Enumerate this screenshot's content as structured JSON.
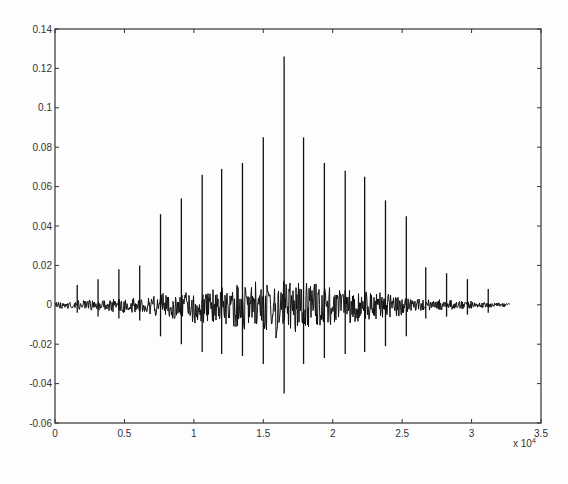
{
  "chart_data": {
    "type": "line",
    "title": "",
    "xlabel": "",
    "ylabel": "",
    "x_multiplier_label": "x 10^4",
    "xlim": [
      0,
      35000
    ],
    "ylim": [
      -0.06,
      0.14
    ],
    "grid": false,
    "legend": null,
    "x_ticks": [
      0,
      0.5,
      1,
      1.5,
      2,
      2.5,
      3,
      3.5
    ],
    "x_tick_labels": [
      "0",
      "0.5",
      "1",
      "1.5",
      "2",
      "2.5",
      "3",
      "3.5"
    ],
    "y_ticks": [
      -0.06,
      -0.04,
      -0.02,
      0,
      0.02,
      0.04,
      0.06,
      0.08,
      0.1,
      0.12,
      0.14
    ],
    "y_tick_labels": [
      "-0.06",
      "-0.04",
      "-0.02",
      "0",
      "0.02",
      "0.04",
      "0.06",
      "0.08",
      "0.1",
      "0.12",
      "0.14"
    ],
    "signal_extent_x": [
      0,
      32800
    ],
    "spikes": {
      "x": [
        1600,
        3100,
        4600,
        6100,
        7600,
        9100,
        10600,
        12000,
        13500,
        15000,
        16500,
        17900,
        19400,
        20900,
        22300,
        23800,
        25300,
        26700,
        28200,
        29700,
        31200
      ],
      "peak": [
        0.01,
        0.013,
        0.018,
        0.02,
        0.046,
        0.054,
        0.066,
        0.069,
        0.072,
        0.085,
        0.126,
        0.085,
        0.072,
        0.068,
        0.065,
        0.053,
        0.045,
        0.019,
        0.016,
        0.013,
        0.008
      ],
      "trough": [
        -0.004,
        -0.006,
        -0.007,
        -0.008,
        -0.016,
        -0.02,
        -0.024,
        -0.025,
        -0.026,
        -0.03,
        -0.045,
        -0.03,
        -0.027,
        -0.025,
        -0.024,
        -0.021,
        -0.016,
        -0.007,
        -0.006,
        -0.005,
        -0.004
      ]
    },
    "envelope": {
      "x": [
        0,
        3000,
        6000,
        7500,
        9000,
        12000,
        15000,
        16500,
        18000,
        21000,
        24000,
        25500,
        27000,
        30000,
        32800
      ],
      "upper": [
        0.002,
        0.003,
        0.004,
        0.006,
        0.008,
        0.01,
        0.013,
        0.016,
        0.013,
        0.009,
        0.006,
        0.004,
        0.003,
        0.002,
        0.001
      ],
      "lower": [
        -0.002,
        -0.003,
        -0.005,
        -0.007,
        -0.009,
        -0.012,
        -0.015,
        -0.019,
        -0.015,
        -0.011,
        -0.008,
        -0.005,
        -0.003,
        -0.002,
        -0.001
      ]
    }
  },
  "axes": {
    "x_multiplier": "x 10",
    "x_multiplier_exp": "4"
  }
}
